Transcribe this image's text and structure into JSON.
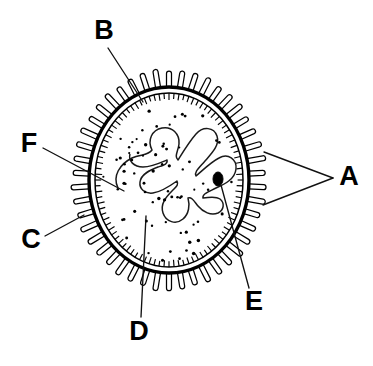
{
  "figure": {
    "background_color": "#ffffff",
    "ink_color": "#000000",
    "width": 373,
    "height": 366
  },
  "labels": [
    {
      "id": "A",
      "text": "A",
      "x": 349,
      "y": 178,
      "points_to": "microvilli-outer-projections",
      "leaders": [
        {
          "x1": 333,
          "y1": 178,
          "x2": 264,
          "y2": 152
        },
        {
          "x1": 333,
          "y1": 178,
          "x2": 263,
          "y2": 205
        }
      ]
    },
    {
      "id": "B",
      "text": "B",
      "x": 104,
      "y": 32,
      "points_to": "cell-membrane",
      "leaders": [
        {
          "x1": 108,
          "y1": 48,
          "x2": 143,
          "y2": 102
        }
      ]
    },
    {
      "id": "C",
      "text": "C",
      "x": 31,
      "y": 241,
      "points_to": "microvillus-single",
      "leaders": [
        {
          "x1": 45,
          "y1": 236,
          "x2": 84,
          "y2": 215
        }
      ]
    },
    {
      "id": "D",
      "text": "D",
      "x": 139,
      "y": 333,
      "points_to": "nucleus-lobe",
      "leaders": [
        {
          "x1": 141,
          "y1": 317,
          "x2": 146,
          "y2": 216
        }
      ]
    },
    {
      "id": "E",
      "text": "E",
      "x": 254,
      "y": 303,
      "points_to": "nucleolus",
      "leaders": [
        {
          "x1": 249,
          "y1": 288,
          "x2": 221,
          "y2": 185
        }
      ]
    },
    {
      "id": "F",
      "text": "F",
      "x": 29,
      "y": 145,
      "points_to": "nucleus-envelope",
      "leaders": [
        {
          "x1": 43,
          "y1": 148,
          "x2": 124,
          "y2": 191
        }
      ]
    }
  ],
  "cell": {
    "name": "cell-body",
    "center_x": 169,
    "center_y": 180,
    "membrane_radius_x": 80,
    "membrane_radius_y": 93,
    "inner_membrane_radius_x": 74,
    "inner_membrane_radius_y": 87,
    "microvilli_count": 46,
    "microvilli_length": 15,
    "microvilli_width": 5,
    "hatch_count": 92,
    "hatch_length": 7
  },
  "nucleus": {
    "name": "lobed-nucleus",
    "description": "multi-lobed convoluted nucleus outline",
    "path": "M 118 188 C 112 176 120 164 132 158 C 140 154 148 156 152 150 C 147 140 152 130 162 128 C 172 126 180 134 179 144 C 178 152 174 156 178 160 C 183 152 189 142 196 134 C 203 126 214 127 217 136 C 220 145 212 153 205 161 C 199 168 194 172 196 176 C 203 170 211 162 219 158 C 228 153 237 159 236 169 C 235 179 225 184 216 188 C 208 192 202 194 203 198 C 209 197 216 196 220 199 C 225 203 224 210 218 213 C 211 216 203 212 198 206 C 194 201 192 197 188 198 C 190 205 189 214 183 219 C 176 225 166 222 163 213 C 160 204 166 197 172 191 C 176 187 179 185 177 181 C 170 186 161 192 153 193 C 145 194 139 189 140 182 C 141 174 150 170 158 167 C 164 165 168 164 167 160 C 160 163 151 167 143 167 C 134 167 128 161 130 154",
    "chromatin_dot_count": 72,
    "nucleolus": {
      "name": "nucleolus",
      "x": 218,
      "y": 179,
      "radius_x": 5,
      "radius_y": 7,
      "color": "#000000"
    }
  }
}
